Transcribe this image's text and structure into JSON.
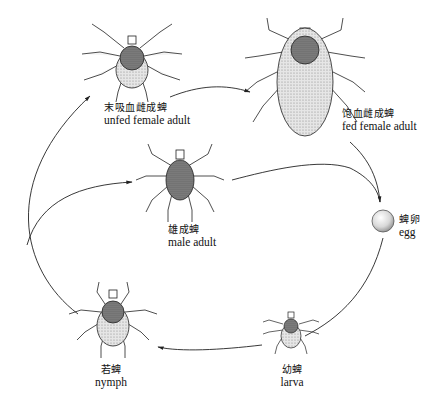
{
  "diagram": {
    "stages": [
      {
        "id": "unfed-female",
        "zh": "末吸血雌成蜱",
        "en": "unfed female adult"
      },
      {
        "id": "fed-female",
        "zh": "饱血雌成蜱",
        "en": "fed female adult"
      },
      {
        "id": "egg",
        "zh": "蜱卵",
        "en": "egg"
      },
      {
        "id": "larva",
        "zh": "幼蜱",
        "en": "larva"
      },
      {
        "id": "nymph",
        "zh": "若蜱",
        "en": "nymph"
      },
      {
        "id": "male",
        "zh": "雄成蜱",
        "en": "male adult"
      }
    ],
    "arrows": [
      {
        "from": "unfed-female",
        "to": "fed-female"
      },
      {
        "from": "fed-female",
        "to": "egg"
      },
      {
        "from": "male",
        "to": "egg"
      },
      {
        "from": "egg",
        "to": "larva"
      },
      {
        "from": "larva",
        "to": "nymph"
      },
      {
        "from": "nymph",
        "to": "unfed-female"
      },
      {
        "from": "nymph",
        "to": "male"
      }
    ],
    "colors": {
      "ink": "#222222",
      "shade": "#9a9a9a",
      "background": "#ffffff"
    }
  }
}
